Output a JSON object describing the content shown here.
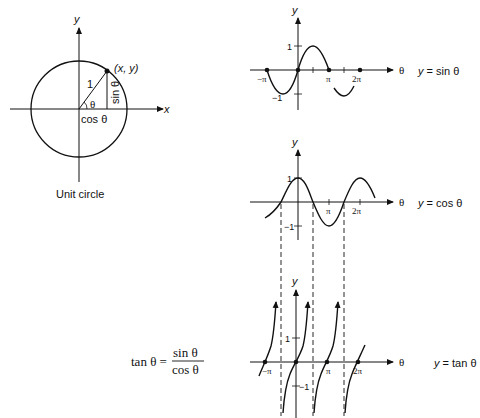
{
  "unit_circle": {
    "caption": "Unit circle",
    "axis_x": "x",
    "axis_y": "y",
    "point_label": "(x, y)",
    "radius_label": "1",
    "angle_label": "θ",
    "opposite_label": "sin θ",
    "adjacent_label": "cos θ"
  },
  "sine_graph": {
    "equation": "y = sin θ",
    "axis_y": "y",
    "axis_x": "θ",
    "ticks": {
      "one": "1",
      "neg_one": "−1",
      "neg_pi": "−π",
      "pi": "π",
      "two_pi": "2π"
    }
  },
  "cosine_graph": {
    "equation": "y = cos θ",
    "axis_y": "y",
    "axis_x": "θ",
    "ticks": {
      "one": "1",
      "neg_one": "−1",
      "pi": "π",
      "two_pi": "2π"
    }
  },
  "tangent_graph": {
    "equation": "y = tan θ",
    "axis_y": "y",
    "axis_x": "θ",
    "ticks": {
      "one": "1",
      "neg_one": "−1",
      "neg_pi": "−π",
      "pi": "π",
      "two_pi": "2π"
    }
  },
  "identity": {
    "lhs": "tan θ =",
    "numerator": "sin θ",
    "denominator": "cos θ"
  }
}
